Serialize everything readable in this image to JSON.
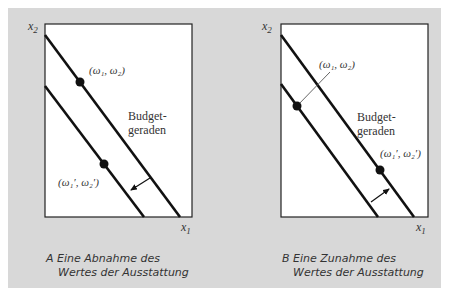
{
  "figure": {
    "background_color": "#d8d8d8",
    "plot_background": "#ffffff",
    "line_color": "#111111",
    "text_color": "#333333"
  },
  "panel_a": {
    "caption_line1": "A Eine Abnahme des",
    "caption_line2": "Wertes der Ausstattung",
    "y_axis_label": "x",
    "y_axis_sub": "2",
    "x_axis_label": "x",
    "x_axis_sub": "1",
    "budget_label_line1": "Budget-",
    "budget_label_line2": "geraden",
    "endowment_label": "(ω₁, ω₂)",
    "new_endowment_label": "(ω₁′, ω₂′)",
    "shift_direction": "inward"
  },
  "panel_b": {
    "caption_line1": "B Eine Zunahme des",
    "caption_line2": "Wertes der Ausstattung",
    "y_axis_label": "x",
    "y_axis_sub": "2",
    "x_axis_label": "x",
    "x_axis_sub": "1",
    "budget_label_line1": "Budget-",
    "budget_label_line2": "geraden",
    "endowment_label": "(ω₁, ω₂)",
    "new_endowment_label": "(ω₁′, ω₂′)",
    "shift_direction": "outward"
  }
}
